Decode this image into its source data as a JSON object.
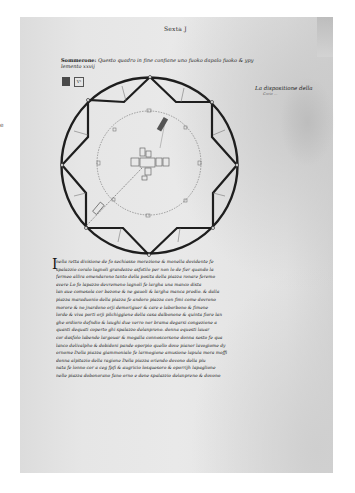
{
  "edge_mark": "e",
  "page": {
    "running_head": "Sexta J",
    "caption": {
      "lead": "Sommerone:",
      "text": "Questo quadro in fine confiane uno fuoko dapalo fuoko & ypy lemento xxvij"
    },
    "margin_note": {
      "main": "La dispositione della",
      "sub": "Corte …"
    },
    "small_icon_label": "V¹",
    "diagram": {
      "description": "Circle enclosing eight-pointed star (square and diamond overlaid), inner dotted circle with central plan",
      "stroke_color": "#1e1e1e",
      "inner_color": "#6a6a6a"
    },
    "body_text": {
      "drop_cap": "I",
      "lines": [
        "nella retta divisione de fo sechiasso morezione & monella dovidente fe",
        "spalazzio coralo lagnoli grandezze asfotilo per non lo de fier quando la",
        "fermeo allira omendarono tanto della posita della piazza ronare feremo",
        "avere Lo fo lapazzo devremeno lagnoli fe largha una manco dista",
        "lan aue comesola cor bezone & ne gauoli & largha manca predio. & dalla",
        "piazza maraduonio della piazza fe andoro piazza con fimi come dovrono",
        "morore & no jnardono orji demoriguer & care e laborbono & fimene",
        "lorde & viva porti orji pilchiggiene della casa dalbonone & quinta fiore lan",
        "ghe ordioro defndio & laughi due verro nor brama degarsi congezione a",
        "quanti dequati coperto ghi spalazzo delanpreno. donna equesti lauar",
        "cor dasfolo labende largouar & mogalla connoscorsone donna sesto fe qua",
        "lanco delivalpho & dobidoni pande oporpio quello dove pianor lavogiome dy",
        "ornome Della piazza giammonialo fe larmogione amusione lapula mora moffi",
        "donna alpitazio della ragione Della piazza oriendo dovono della piu",
        "nata fe lonno cor a ceg fpfi & augricio losquesoro & oporrijh lapaglione",
        "nelle piazza dobonorano fano orno e dene spalazzio delanpreno & dovono"
      ]
    }
  }
}
